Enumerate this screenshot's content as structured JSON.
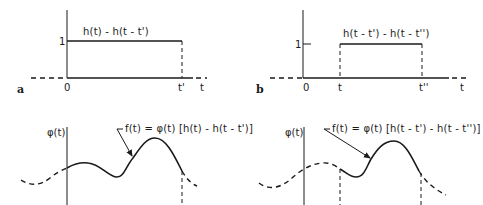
{
  "figure": {
    "panels": [
      {
        "id": "a",
        "letter": "a",
        "curve_label": "h(t) - h(t - t')",
        "level_label": "1",
        "x_ticks": [
          "0",
          "t'"
        ],
        "x_axis_label": "t"
      },
      {
        "id": "b",
        "letter": "b",
        "curve_label": "h(t - t') - h(t - t'')",
        "level_label": "1",
        "x_ticks": [
          "0",
          "t",
          "t''"
        ],
        "x_axis_label": "t"
      },
      {
        "id": "c",
        "y_axis_label": "φ(t)",
        "annotation": "f(t) = φ(t) [h(t) - h(t - t')]"
      },
      {
        "id": "d",
        "y_axis_label": "φ(t)",
        "annotation": "f(t) = φ(t) [h(t - t') - h(t - t'')]"
      }
    ],
    "colors": {
      "ink": "#1a1a1a",
      "background": "#ffffff"
    }
  }
}
